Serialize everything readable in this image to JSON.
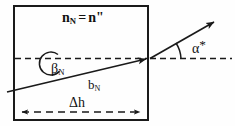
{
  "figure": {
    "kind": "optics-refraction-diagram",
    "width": 235,
    "height": 126,
    "background_color": "#fefefe",
    "stroke_color": "#1a1a1a",
    "labels": {
      "medium_index_lead": "n",
      "medium_index_sub": "N",
      "medium_index_eq": "=",
      "medium_index_right": "n\"",
      "beta_symbol": "β",
      "beta_sub": "N",
      "ray_symbol": "b",
      "ray_sub": "N",
      "delta_h": "Δh",
      "alpha_symbol": "α",
      "alpha_star": "*"
    },
    "elements": {
      "box_name": "medium-boundary-box",
      "dashed_axis_name": "optical-axis-dashed-line",
      "internal_ray_name": "internal-ray-b-N",
      "exit_ray_name": "exit-ray-arrow",
      "beta_arc_name": "beta-angle-arc",
      "alpha_arc_name": "alpha-angle-arc",
      "dh_measure_name": "delta-h-dimension-arrow"
    }
  }
}
